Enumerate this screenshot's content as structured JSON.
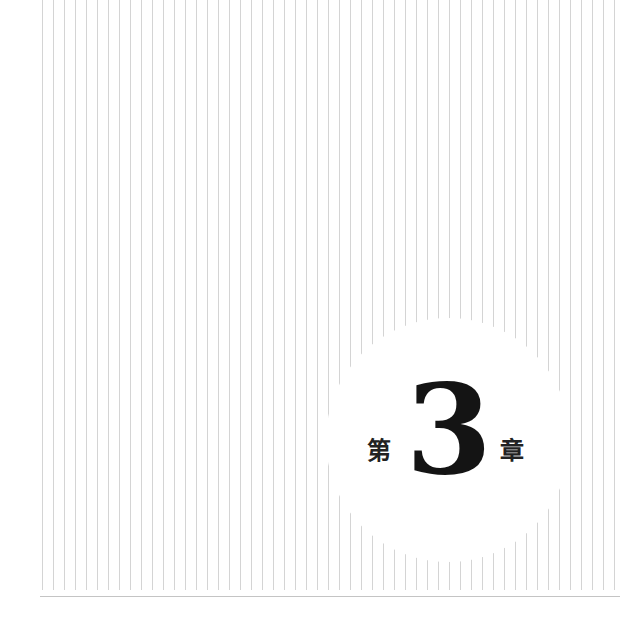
{
  "chapter": {
    "prefix": "第",
    "number": "3",
    "suffix": "章"
  },
  "colors": {
    "background": "#ffffff",
    "line": "#d4d4d4",
    "text": "#141414"
  }
}
